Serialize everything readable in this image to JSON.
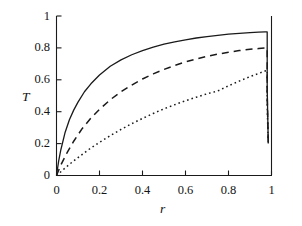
{
  "chart_data": {
    "type": "line",
    "title": "",
    "subtitle": "",
    "xlabel": "r",
    "ylabel": "T",
    "xlim": [
      0,
      1
    ],
    "ylim": [
      0,
      1
    ],
    "grid": false,
    "legend": "none",
    "background": "#ffffff",
    "line_color": "#1a1a1a",
    "xticks": [
      0,
      0.2,
      0.4,
      0.6,
      0.8,
      1
    ],
    "xtick_labels": [
      "0",
      "0.2",
      "0.4",
      "0.6",
      "0.8",
      "1"
    ],
    "yticks": [
      0,
      0.2,
      0.4,
      0.6,
      0.8,
      1
    ],
    "ytick_labels": [
      "0",
      "0.2",
      "0.4",
      "0.6",
      "0.8",
      "1"
    ],
    "tick_direction": "in",
    "spines": [
      "left",
      "bottom",
      "right"
    ],
    "series": [
      {
        "name": "solid-curve",
        "style": "solid",
        "peak_value": 0.9,
        "drop_value": 0.2,
        "x": [
          0,
          0.01,
          0.02,
          0.04,
          0.06,
          0.08,
          0.1,
          0.13,
          0.16,
          0.2,
          0.25,
          0.3,
          0.35,
          0.4,
          0.45,
          0.5,
          0.55,
          0.6,
          0.65,
          0.7,
          0.75,
          0.8,
          0.85,
          0.9,
          0.94,
          0.97,
          0.98,
          0.98,
          0.985
        ],
        "y": [
          0,
          0.09,
          0.16,
          0.27,
          0.35,
          0.41,
          0.46,
          0.525,
          0.575,
          0.63,
          0.685,
          0.725,
          0.757,
          0.783,
          0.805,
          0.823,
          0.838,
          0.851,
          0.862,
          0.871,
          0.879,
          0.886,
          0.891,
          0.896,
          0.899,
          0.9,
          0.9,
          0.55,
          0.2
        ]
      },
      {
        "name": "dashed-curve",
        "style": "dashed",
        "peak_value": 0.8,
        "drop_value": 0.2,
        "x": [
          0,
          0.02,
          0.05,
          0.08,
          0.12,
          0.16,
          0.2,
          0.25,
          0.3,
          0.35,
          0.4,
          0.45,
          0.5,
          0.55,
          0.6,
          0.65,
          0.7,
          0.75,
          0.8,
          0.85,
          0.9,
          0.94,
          0.97,
          0.98,
          0.98,
          0.985
        ],
        "y": [
          0,
          0.065,
          0.145,
          0.215,
          0.295,
          0.36,
          0.415,
          0.475,
          0.525,
          0.567,
          0.605,
          0.637,
          0.665,
          0.69,
          0.712,
          0.731,
          0.747,
          0.761,
          0.773,
          0.783,
          0.791,
          0.796,
          0.799,
          0.8,
          0.5,
          0.2
        ]
      },
      {
        "name": "dotted-curve",
        "style": "dotted",
        "peak_value": 0.66,
        "drop_value": 0.2,
        "x": [
          0,
          0.03,
          0.06,
          0.1,
          0.15,
          0.2,
          0.25,
          0.3,
          0.35,
          0.4,
          0.45,
          0.5,
          0.55,
          0.6,
          0.65,
          0.7,
          0.75,
          0.8,
          0.85,
          0.9,
          0.94,
          0.97,
          0.98,
          0.98,
          0.985
        ],
        "y": [
          0,
          0.035,
          0.07,
          0.112,
          0.163,
          0.208,
          0.25,
          0.289,
          0.325,
          0.358,
          0.389,
          0.418,
          0.444,
          0.469,
          0.491,
          0.512,
          0.53,
          0.562,
          0.592,
          0.62,
          0.64,
          0.655,
          0.66,
          0.43,
          0.2
        ]
      }
    ]
  }
}
